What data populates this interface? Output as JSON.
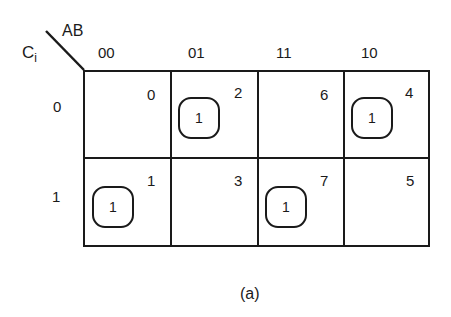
{
  "diagram": {
    "type": "karnaugh-map",
    "corner": {
      "row_var_label": "C",
      "row_var_subscript": "i",
      "col_var_label": "AB"
    },
    "columns": [
      "00",
      "01",
      "11",
      "10"
    ],
    "rows": [
      "0",
      "1"
    ],
    "cells": [
      [
        {
          "index": "0",
          "value": ""
        },
        {
          "index": "2",
          "value": "1"
        },
        {
          "index": "6",
          "value": ""
        },
        {
          "index": "4",
          "value": "1"
        }
      ],
      [
        {
          "index": "1",
          "value": "1"
        },
        {
          "index": "3",
          "value": ""
        },
        {
          "index": "7",
          "value": "1"
        },
        {
          "index": "5",
          "value": ""
        }
      ]
    ],
    "caption": "(a)"
  }
}
